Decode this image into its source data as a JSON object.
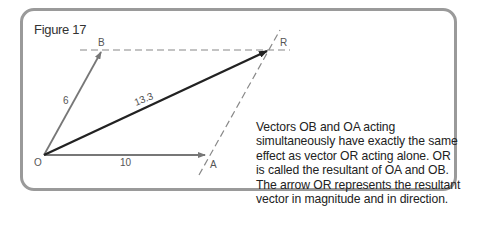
{
  "figure": {
    "title": "Figure 17",
    "labels": {
      "O": "O",
      "A": "A",
      "B": "B",
      "R": "R",
      "OA": "10",
      "OB": "6",
      "OR": "13.3"
    },
    "colors": {
      "frame": "#9a9a9a",
      "component_vector": "#777777",
      "resultant_vector": "#222222",
      "dashed_line": "#888888"
    },
    "caption": "Vectors OB and OA acting simultaneously have exactly the same effect as vector OR acting alone. OR is called the resultant of OA and OB. The arrow OR represents the resultant vector in magnitude and in direction."
  }
}
